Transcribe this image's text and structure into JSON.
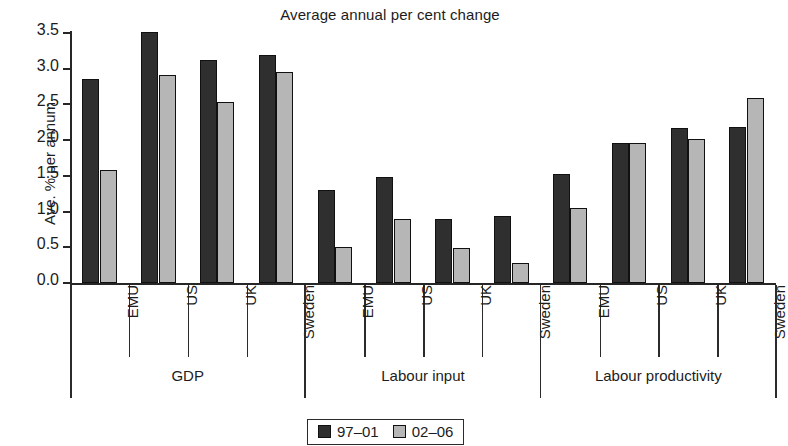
{
  "chart_data": {
    "type": "bar",
    "title": "Average annual per cent change",
    "xlabel": "",
    "ylabel": "Ave. % per annum",
    "ylim": [
      0.0,
      3.5
    ],
    "yticks": [
      "0.0",
      "0.5",
      "1.0",
      "1.5",
      "2.0",
      "2.5",
      "3.0",
      "3.5"
    ],
    "ytick_values": [
      0.0,
      0.5,
      1.0,
      1.5,
      2.0,
      2.5,
      3.0,
      3.5
    ],
    "grid": false,
    "legend_position": "bottom-center",
    "groups": [
      {
        "label": "GDP",
        "categories": [
          "EMU",
          "US",
          "UK",
          "Sweden"
        ]
      },
      {
        "label": "Labour input",
        "categories": [
          "EMU",
          "US",
          "UK",
          "Sweden"
        ]
      },
      {
        "label": "Labour productivity",
        "categories": [
          "EMU",
          "US",
          "UK",
          "Sweden"
        ]
      }
    ],
    "categories": [
      "EMU",
      "US",
      "UK",
      "Sweden",
      "EMU",
      "US",
      "UK",
      "Sweden",
      "EMU",
      "US",
      "UK",
      "Sweden"
    ],
    "series": [
      {
        "name": "97-01",
        "label": "97–01",
        "color": "#2f2f2f",
        "values": [
          2.85,
          3.51,
          3.12,
          3.19,
          1.3,
          1.49,
          0.89,
          0.94,
          1.52,
          1.96,
          2.17,
          2.19
        ]
      },
      {
        "name": "02-06",
        "label": "02–06",
        "color": "#b6b6b6",
        "values": [
          1.58,
          2.91,
          2.54,
          2.95,
          0.5,
          0.89,
          0.49,
          0.28,
          1.05,
          1.96,
          2.02,
          2.59
        ]
      }
    ]
  }
}
